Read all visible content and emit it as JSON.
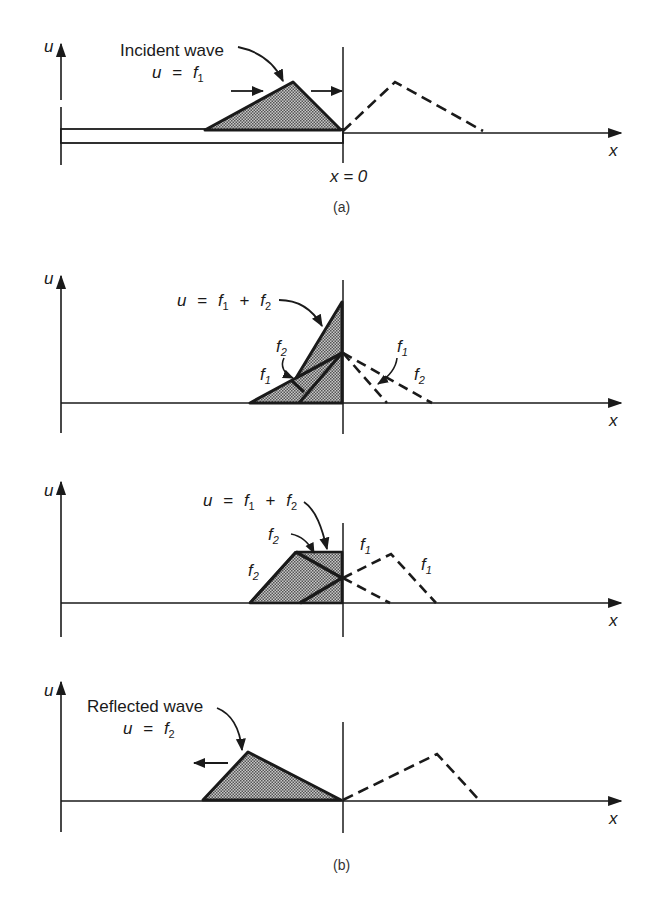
{
  "figure": {
    "panel_a": {
      "caption": "(a)",
      "axis_u": "u",
      "axis_x": "x",
      "boundary_label": "x = 0",
      "annotation_line1": "Incident wave",
      "annotation_eq_var": "u",
      "annotation_eq_sign": "=",
      "annotation_eq_f": "f",
      "annotation_eq_sub": "1"
    },
    "panel_b": {
      "caption": "(b)",
      "stage1": {
        "axis_u": "u",
        "axis_x": "x",
        "sum_var": "u",
        "sum_eq": "=",
        "f": "f",
        "sub1": "1",
        "plus": "+",
        "sub2": "2",
        "label_f2": "f",
        "label_f2_sub": "2",
        "label_f1": "f",
        "label_f1_sub": "1",
        "dash_f1": "f",
        "dash_f1_sub": "1",
        "dash_f2": "f",
        "dash_f2_sub": "2"
      },
      "stage2": {
        "axis_u": "u",
        "axis_x": "x",
        "sum_var": "u",
        "sum_eq": "=",
        "f": "f",
        "sub1": "1",
        "plus": "+",
        "sub2": "2",
        "label_f2_top": "f",
        "label_f2_top_sub": "2",
        "label_f2_left": "f",
        "label_f2_left_sub": "2",
        "dash_f1_a": "f",
        "dash_f1_a_sub": "1",
        "dash_f1_b": "f",
        "dash_f1_b_sub": "1"
      },
      "stage3": {
        "axis_u": "u",
        "axis_x": "x",
        "annotation_line1": "Reflected wave",
        "annotation_eq_var": "u",
        "annotation_eq_sign": "=",
        "annotation_eq_f": "f",
        "annotation_eq_sub": "2"
      }
    },
    "colors": {
      "ink": "#1a1a1a",
      "shade": "#9a9a9a",
      "background": "#ffffff"
    }
  }
}
